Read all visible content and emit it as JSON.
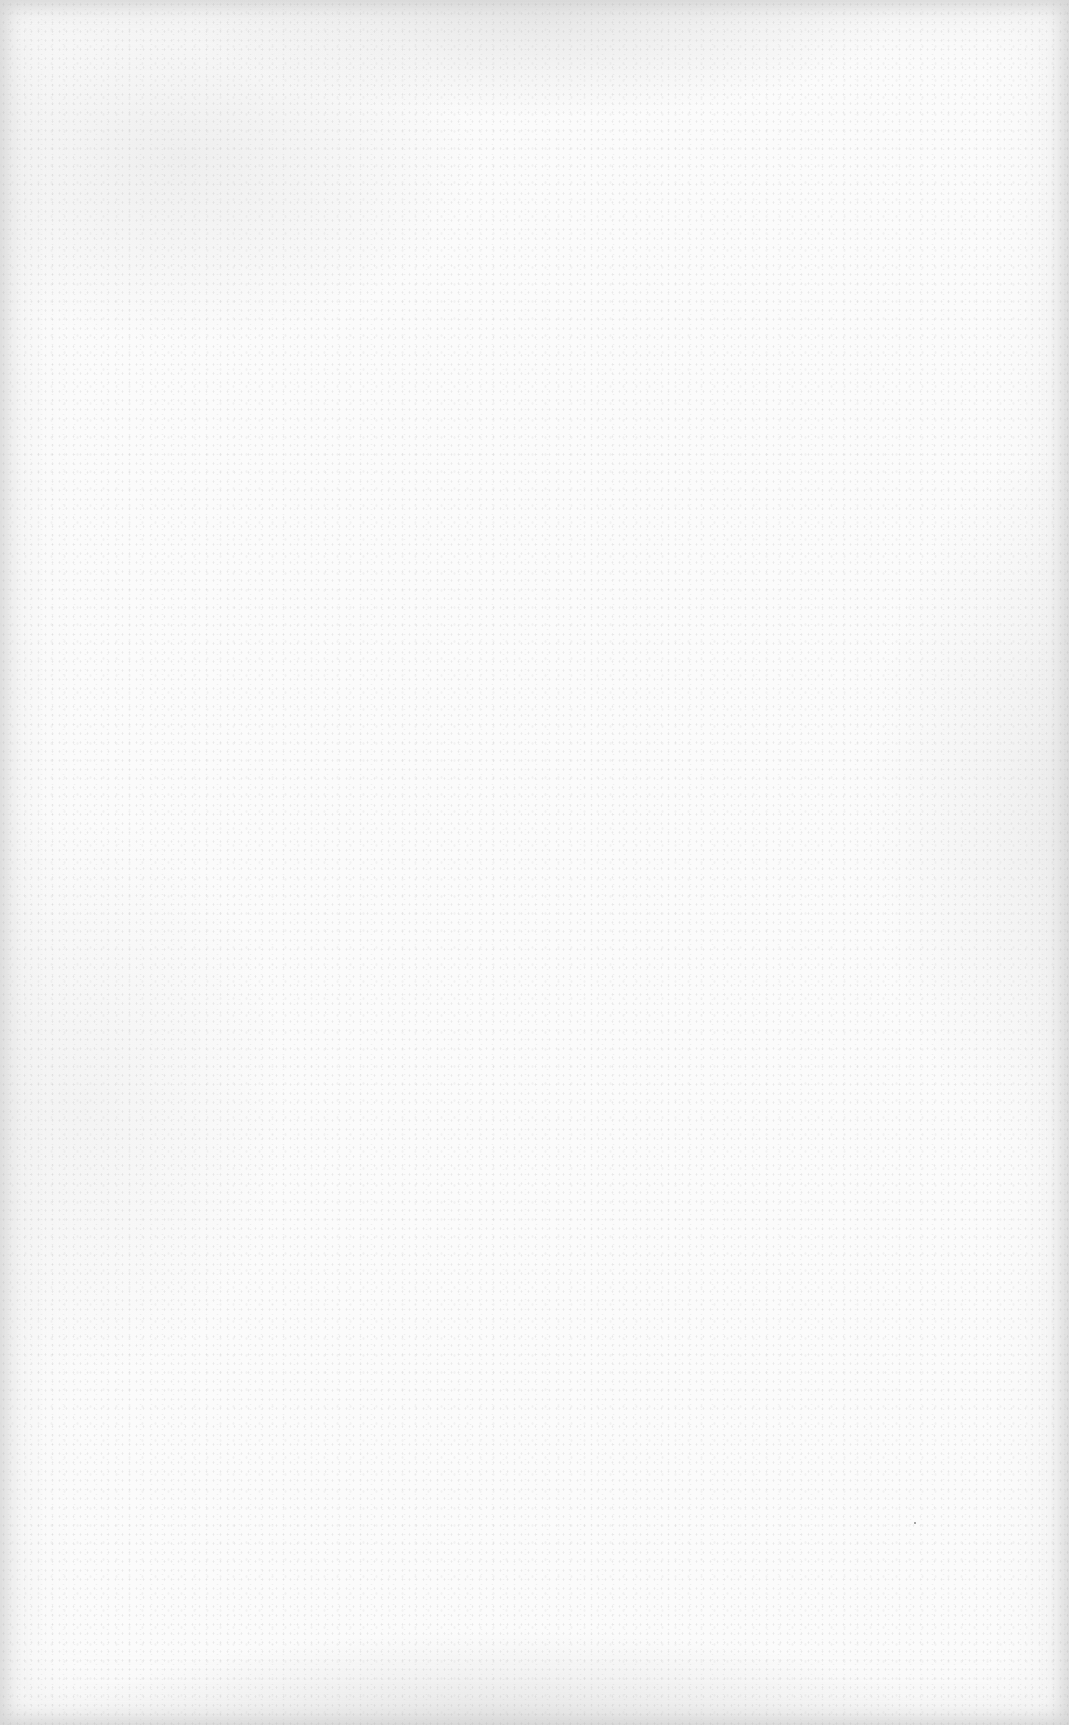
{
  "page": {
    "type": "blank-scanned-page",
    "background_color": "#fbfbfb",
    "edge_shade_color": "#bebebe",
    "text_content": ""
  }
}
